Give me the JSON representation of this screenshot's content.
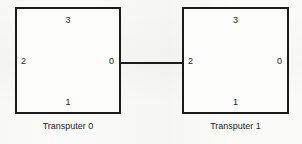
{
  "figure": {
    "type": "network-topology-diagram",
    "line_color": "#1b1b1b",
    "background_color": "#fbfbfa"
  },
  "nodes": [
    {
      "id": "transputer-0",
      "caption": "Transputer 0",
      "ports": {
        "top": "3",
        "right": "0",
        "bottom": "1",
        "left": "2"
      }
    },
    {
      "id": "transputer-1",
      "caption": "Transputer 1",
      "ports": {
        "top": "3",
        "right": "0",
        "bottom": "1",
        "left": "2"
      }
    }
  ],
  "connections": [
    {
      "from_node": "Transputer 0",
      "from_port": "0",
      "to_node": "Transputer 1",
      "to_port": "2"
    }
  ]
}
